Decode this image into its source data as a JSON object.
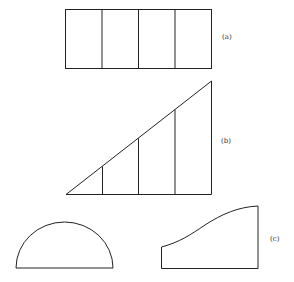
{
  "figure": {
    "labels": {
      "a": "(a)",
      "b": "(b)",
      "c": "(c)"
    },
    "shapes": {
      "a": {
        "type": "rectangle",
        "subdivisions": 4
      },
      "b": {
        "type": "right-triangle",
        "subdivisions": 4
      },
      "c": [
        {
          "type": "semicircle"
        },
        {
          "type": "curved-top-region"
        }
      ]
    },
    "stroke_color": "#222222"
  }
}
